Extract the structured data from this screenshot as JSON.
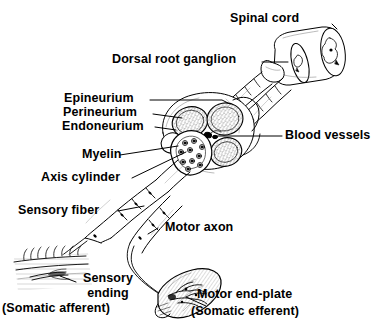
{
  "figure": {
    "background_color": "#ffffff",
    "ink_color": "#000000"
  },
  "labels": {
    "spinal_cord": "Spinal cord",
    "dorsal_root_ganglion": "Dorsal root ganglion",
    "epineurium": "Epineurium",
    "perineurium": "Perineurium",
    "endoneurium": "Endoneurium",
    "blood_vessels": "Blood vessels",
    "myelin": "Myelin",
    "axis_cylinder": "Axis cylinder",
    "sensory_fiber": "Sensory fiber",
    "motor_axon": "Motor axon",
    "sensory_ending_line1": "Sensory",
    "sensory_ending_line2": "ending",
    "sensory_ending_line3": "(Somatic afferent)",
    "motor_end_plate_line1": "Motor end-plate",
    "motor_end_plate_line2": "(Somatic efferent)"
  },
  "structures": [
    {
      "name": "spinal-cord-segment",
      "description": "cylindrical cord stump with butterfly gray matter, upper right"
    },
    {
      "name": "dorsal-root-ganglion",
      "description": "ovoid swelling on dorsal root"
    },
    {
      "name": "nerve-roots",
      "description": "two segmented roots joining cord to nerve trunk"
    },
    {
      "name": "nerve-trunk-cross-section",
      "description": "cut face of nerve showing four stippled fascicles"
    },
    {
      "name": "fascicle",
      "description": "stippled bundle wrapped by perineurium",
      "count": 4
    },
    {
      "name": "enlarged-fascicle",
      "description": "magnified fascicle showing ringed myelinated axons"
    },
    {
      "name": "blood-vessels",
      "description": "small dark vessels in epineurium between fascicles"
    },
    {
      "name": "myelinated-fibers",
      "description": "two segmented fibers with nodes of Ranvier leaving the trunk"
    },
    {
      "name": "sensory-ending-skin",
      "description": "free nerve ending in hairy skin, lower left"
    },
    {
      "name": "motor-end-plate-muscle",
      "description": "striated muscle fiber with branching end-plate, lower right"
    }
  ]
}
